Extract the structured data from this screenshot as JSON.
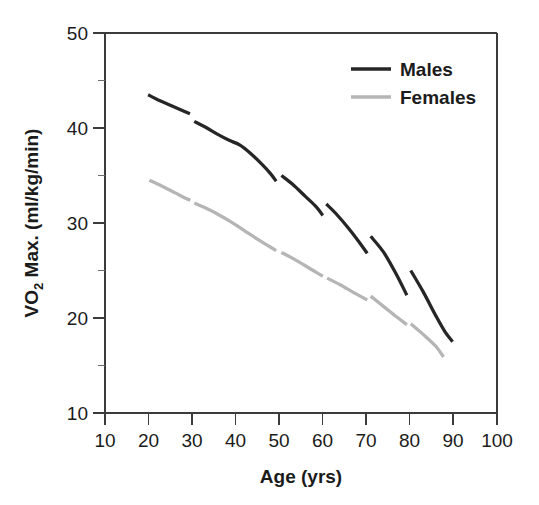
{
  "chart_data": {
    "type": "line",
    "title": "",
    "xlabel": "Age (yrs)",
    "ylabel": "VO2 Max. (ml/kg/min)",
    "ylabel_prefix": "VO",
    "ylabel_subscript": "2",
    "ylabel_suffix": " Max. (ml/kg/min)",
    "xlim": [
      10,
      100
    ],
    "ylim": [
      10,
      50
    ],
    "xticks": [
      10,
      20,
      30,
      40,
      50,
      60,
      70,
      80,
      90,
      100
    ],
    "xtick_labels": [
      "10",
      "20",
      "30",
      "40",
      "50",
      "60",
      "70",
      "80",
      "90",
      "100"
    ],
    "yticks": [
      10,
      20,
      30,
      40,
      50
    ],
    "ytick_labels": [
      "10",
      "20",
      "30",
      "40",
      "50"
    ],
    "y_minor_ticks": [
      15,
      25,
      35,
      45
    ],
    "grid": false,
    "legend_position": "top-right",
    "series": [
      {
        "name": "Males",
        "color": "#262626",
        "style": "solid-segmented",
        "segments": [
          {
            "cohort": "20-30",
            "points": [
              [
                19.9,
                43.5
              ],
              [
                22.0,
                43.0
              ],
              [
                25.0,
                42.4
              ],
              [
                28.0,
                41.8
              ],
              [
                29.5,
                41.5
              ]
            ]
          },
          {
            "cohort": "30-50",
            "points": [
              [
                30.5,
                40.7
              ],
              [
                33.0,
                40.1
              ],
              [
                36.0,
                39.3
              ],
              [
                38.5,
                38.7
              ],
              [
                41.0,
                38.2
              ],
              [
                43.5,
                37.3
              ],
              [
                46.0,
                36.2
              ],
              [
                48.0,
                35.2
              ],
              [
                49.3,
                34.4
              ]
            ]
          },
          {
            "cohort": "50-60",
            "points": [
              [
                50.5,
                35.0
              ],
              [
                53.0,
                34.1
              ],
              [
                56.0,
                32.8
              ],
              [
                58.5,
                31.7
              ],
              [
                60.0,
                30.8
              ]
            ]
          },
          {
            "cohort": "60-70",
            "points": [
              [
                60.8,
                32.0
              ],
              [
                63.0,
                31.0
              ],
              [
                66.0,
                29.4
              ],
              [
                68.5,
                27.9
              ],
              [
                70.2,
                26.8
              ]
            ]
          },
          {
            "cohort": "70-80",
            "points": [
              [
                71.0,
                28.6
              ],
              [
                74.0,
                26.9
              ],
              [
                77.0,
                24.5
              ],
              [
                79.3,
                22.4
              ]
            ]
          },
          {
            "cohort": "80-90",
            "points": [
              [
                80.2,
                25.0
              ],
              [
                83.0,
                22.8
              ],
              [
                86.0,
                20.2
              ],
              [
                88.0,
                18.6
              ],
              [
                89.8,
                17.5
              ]
            ]
          }
        ]
      },
      {
        "name": "Females",
        "color": "#b5b5b5",
        "style": "solid-segmented",
        "segments": [
          {
            "cohort": "20-30",
            "points": [
              [
                20.2,
                34.5
              ],
              [
                23.0,
                33.9
              ],
              [
                26.0,
                33.2
              ],
              [
                28.5,
                32.6
              ],
              [
                29.6,
                32.4
              ]
            ]
          },
          {
            "cohort": "30-50",
            "points": [
              [
                30.5,
                32.1
              ],
              [
                33.0,
                31.6
              ],
              [
                36.0,
                30.9
              ],
              [
                39.0,
                30.1
              ],
              [
                42.0,
                29.2
              ],
              [
                45.0,
                28.3
              ],
              [
                47.5,
                27.6
              ],
              [
                49.3,
                27.1
              ]
            ]
          },
          {
            "cohort": "50-60",
            "points": [
              [
                50.5,
                26.9
              ],
              [
                53.0,
                26.3
              ],
              [
                56.0,
                25.5
              ],
              [
                58.5,
                24.8
              ],
              [
                60.0,
                24.4
              ]
            ]
          },
          {
            "cohort": "60-70",
            "points": [
              [
                61.0,
                24.2
              ],
              [
                64.0,
                23.5
              ],
              [
                67.0,
                22.7
              ],
              [
                69.0,
                22.2
              ],
              [
                70.2,
                21.9
              ]
            ]
          },
          {
            "cohort": "70-80",
            "points": [
              [
                71.0,
                22.3
              ],
              [
                74.0,
                21.2
              ],
              [
                77.0,
                20.1
              ],
              [
                79.3,
                19.3
              ]
            ]
          },
          {
            "cohort": "80-90",
            "points": [
              [
                80.2,
                19.4
              ],
              [
                83.0,
                18.3
              ],
              [
                86.0,
                17.0
              ],
              [
                87.7,
                15.9
              ]
            ]
          }
        ]
      }
    ]
  },
  "legend": {
    "entries": [
      {
        "label": "Males",
        "color": "#262626"
      },
      {
        "label": "Females",
        "color": "#b5b5b5"
      }
    ]
  }
}
